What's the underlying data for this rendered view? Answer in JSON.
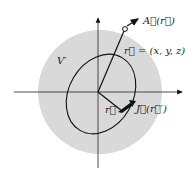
{
  "diagram": {
    "volume_label": "V′",
    "field_point_label": "r⃗ = (x, y, z)",
    "field_label": "A⃗(r⃗)",
    "source_point_label": "r⃗′",
    "current_label": "J⃗(r⃗′)",
    "colors": {
      "region": "#d9d9d9",
      "lines": "#111111",
      "background": "#ffffff"
    }
  }
}
